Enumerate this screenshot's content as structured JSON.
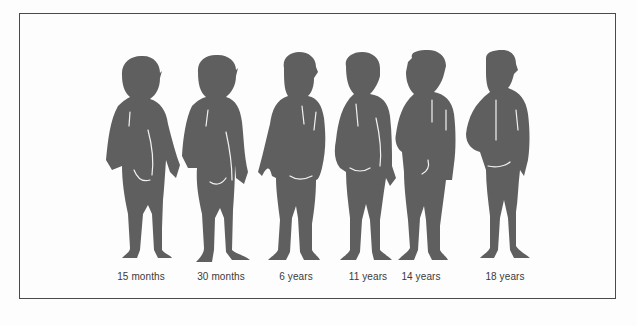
{
  "figure": {
    "silhouette_color": "#5f5f5f",
    "highlight_color": "#f2f2f2",
    "border_color": "#4a4a4a",
    "items": [
      {
        "label": "15 months",
        "cx": 141
      },
      {
        "label": "30 months",
        "cx": 221
      },
      {
        "label": "6 years",
        "cx": 296
      },
      {
        "label": "11 years",
        "cx": 368
      },
      {
        "label": "14 years",
        "cx": 421
      },
      {
        "label": "18 years",
        "cx": 505
      }
    ]
  }
}
